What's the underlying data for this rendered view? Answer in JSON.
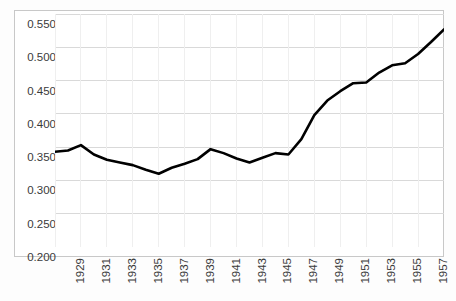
{
  "chart_data": {
    "type": "line",
    "title": "",
    "subtitle": "",
    "xlabel": "",
    "ylabel": "",
    "grid": true,
    "legend": false,
    "legend_position": "none",
    "line_color": "#000000",
    "grid_color": "#d9d9d9",
    "border_color": "#c8c8c8",
    "background_color": "#ffffff",
    "ylim": [
      0.2,
      0.55
    ],
    "xlim": [
      1929,
      1959
    ],
    "ytick_labels": [
      "0.550",
      "0.500",
      "0.450",
      "0.400",
      "0.350",
      "0.300",
      "0.250",
      "0.200"
    ],
    "ytick_values": [
      0.55,
      0.5,
      0.45,
      0.4,
      0.35,
      0.3,
      0.25,
      0.2
    ],
    "xtick_labels": [
      "1929",
      "1931",
      "1933",
      "1935",
      "1937",
      "1939",
      "1941",
      "1943",
      "1945",
      "1947",
      "1949",
      "1951",
      "1953",
      "1955",
      "1957",
      "1959"
    ],
    "xtick_values": [
      1929,
      1931,
      1933,
      1935,
      1937,
      1939,
      1941,
      1943,
      1945,
      1947,
      1949,
      1951,
      1953,
      1955,
      1957,
      1959
    ],
    "x": [
      1929,
      1930,
      1931,
      1932,
      1933,
      1934,
      1935,
      1936,
      1937,
      1938,
      1939,
      1940,
      1941,
      1942,
      1943,
      1944,
      1945,
      1946,
      1947,
      1948,
      1949,
      1950,
      1951,
      1952,
      1953,
      1954,
      1955,
      1956,
      1957,
      1958,
      1959
    ],
    "values": [
      0.343,
      0.345,
      0.353,
      0.339,
      0.331,
      0.327,
      0.323,
      0.316,
      0.31,
      0.319,
      0.325,
      0.332,
      0.347,
      0.341,
      0.333,
      0.327,
      0.334,
      0.341,
      0.339,
      0.362,
      0.398,
      0.42,
      0.434,
      0.446,
      0.447,
      0.462,
      0.473,
      0.476,
      0.49,
      0.508,
      0.527
    ],
    "series_name": ""
  }
}
